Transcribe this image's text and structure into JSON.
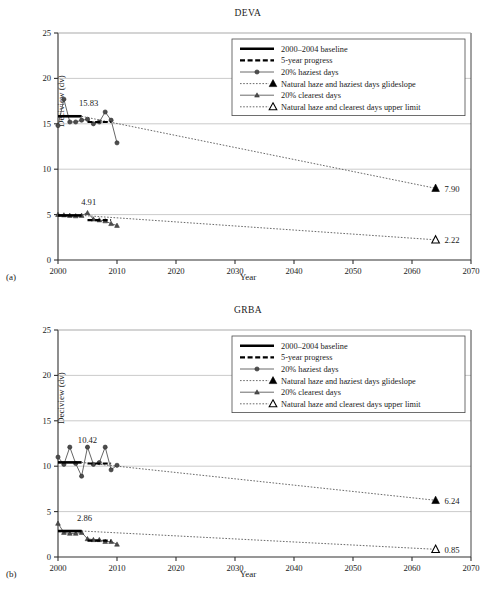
{
  "figure": {
    "axis_label_y": "Deciview (dv)",
    "axis_label_x": "Year",
    "panel_a_tag": "(a)",
    "panel_b_tag": "(b)"
  },
  "legend": {
    "items": [
      {
        "label": "2000–2004 baseline",
        "marker": "thick-solid-line"
      },
      {
        "label": "5-year progress",
        "marker": "thick-dashed-line"
      },
      {
        "label": "20% haziest days",
        "marker": "line-with-circle"
      },
      {
        "label": "Natural haze and haziest days glideslope",
        "marker": "dotted-line-filled-triangle"
      },
      {
        "label": "20% clearest days",
        "marker": "line-with-triangle"
      },
      {
        "label": "Natural haze and clearest days upper limit",
        "marker": "dotted-line-hollow-triangle"
      }
    ]
  },
  "chart_data": [
    {
      "type": "line",
      "title": "DEVA",
      "xlabel": "Year",
      "ylabel": "Deciview (dv)",
      "xlim": [
        2000,
        2070
      ],
      "ylim": [
        0,
        25
      ],
      "xticks": [
        2000,
        2010,
        2020,
        2030,
        2040,
        2050,
        2060,
        2070
      ],
      "yticks": [
        0,
        5,
        10,
        15,
        20,
        25
      ],
      "grid": "horizontal",
      "legend_position": "upper-right",
      "annotations": [
        {
          "text": "15.83",
          "x": 2005.2,
          "y": 17.0,
          "refers_to": "haziest-days-baseline"
        },
        {
          "text": "4.91",
          "x": 2005.2,
          "y": 6.1,
          "refers_to": "clearest-days-baseline"
        },
        {
          "text": "7.90",
          "x": 2065.5,
          "y": 7.9,
          "refers_to": "haziest-days-glideslope-endpoint"
        },
        {
          "text": "2.22",
          "x": 2065.5,
          "y": 2.22,
          "refers_to": "clearest-days-limit-endpoint"
        }
      ],
      "series": [
        {
          "name": "20% haziest days",
          "x": [
            2000,
            2001,
            2002,
            2003,
            2004,
            2005,
            2006,
            2007,
            2008,
            2009,
            2010
          ],
          "values": [
            14.8,
            17.7,
            15.2,
            15.2,
            15.4,
            15.5,
            15.0,
            15.2,
            16.3,
            15.4,
            12.9
          ]
        },
        {
          "name": "20% clearest days",
          "x": [
            2000,
            2001,
            2002,
            2003,
            2004,
            2005,
            2006,
            2007,
            2008,
            2009,
            2010
          ],
          "values": [
            5.0,
            4.95,
            4.9,
            4.85,
            4.9,
            5.2,
            4.5,
            4.4,
            4.3,
            4.0,
            3.8
          ]
        },
        {
          "name": "2000–2004 baseline (haziest)",
          "x": [
            2000,
            2004
          ],
          "values": [
            15.83,
            15.83
          ]
        },
        {
          "name": "2000–2004 baseline (clearest)",
          "x": [
            2000,
            2004
          ],
          "values": [
            4.91,
            4.91
          ]
        },
        {
          "name": "5-year progress (haziest)",
          "x": [
            2005,
            2009
          ],
          "values": [
            15.2,
            15.2
          ]
        },
        {
          "name": "5-year progress (clearest)",
          "x": [
            2005,
            2009
          ],
          "values": [
            4.4,
            4.4
          ]
        },
        {
          "name": "Natural haze and haziest days glideslope",
          "x": [
            2004,
            2064
          ],
          "values": [
            15.83,
            7.9
          ]
        },
        {
          "name": "Natural haze and clearest days upper limit",
          "x": [
            2004,
            2064
          ],
          "values": [
            4.91,
            2.22
          ]
        }
      ]
    },
    {
      "type": "line",
      "title": "GRBA",
      "xlabel": "Year",
      "ylabel": "Deciview (dv)",
      "xlim": [
        2000,
        2070
      ],
      "ylim": [
        0,
        25
      ],
      "xticks": [
        2000,
        2010,
        2020,
        2030,
        2040,
        2050,
        2060,
        2070
      ],
      "yticks": [
        0,
        5,
        10,
        15,
        20,
        25
      ],
      "grid": "horizontal",
      "legend_position": "upper-right",
      "annotations": [
        {
          "text": "10.42",
          "x": 2005.0,
          "y": 12.6,
          "refers_to": "haziest-days-baseline"
        },
        {
          "text": "2.86",
          "x": 2004.5,
          "y": 4.0,
          "refers_to": "clearest-days-baseline"
        },
        {
          "text": "6.24",
          "x": 2065.5,
          "y": 6.24,
          "refers_to": "haziest-days-glideslope-endpoint"
        },
        {
          "text": "0.85",
          "x": 2065.5,
          "y": 0.85,
          "refers_to": "clearest-days-limit-endpoint"
        }
      ],
      "series": [
        {
          "name": "20% haziest days",
          "x": [
            2000,
            2001,
            2002,
            2003,
            2004,
            2005,
            2006,
            2007,
            2008,
            2009,
            2010
          ],
          "values": [
            11.0,
            10.2,
            12.1,
            10.3,
            8.9,
            12.1,
            10.2,
            10.4,
            12.1,
            9.6,
            10.1
          ]
        },
        {
          "name": "20% clearest days",
          "x": [
            2000,
            2001,
            2002,
            2003,
            2004,
            2005,
            2006,
            2007,
            2008,
            2009,
            2010
          ],
          "values": [
            3.7,
            2.7,
            2.6,
            2.6,
            2.7,
            2.0,
            1.9,
            1.9,
            1.7,
            1.7,
            1.4
          ]
        },
        {
          "name": "2000–2004 baseline (haziest)",
          "x": [
            2000,
            2004
          ],
          "values": [
            10.42,
            10.42
          ]
        },
        {
          "name": "2000–2004 baseline (clearest)",
          "x": [
            2000,
            2004
          ],
          "values": [
            2.86,
            2.86
          ]
        },
        {
          "name": "5-year progress (haziest)",
          "x": [
            2005,
            2009
          ],
          "values": [
            10.3,
            10.3
          ]
        },
        {
          "name": "5-year progress (clearest)",
          "x": [
            2005,
            2009
          ],
          "values": [
            1.8,
            1.8
          ]
        },
        {
          "name": "Natural haze and haziest days glideslope",
          "x": [
            2004,
            2064
          ],
          "values": [
            10.42,
            6.24
          ]
        },
        {
          "name": "Natural haze and clearest days upper limit",
          "x": [
            2004,
            2064
          ],
          "values": [
            2.86,
            0.85
          ]
        }
      ]
    }
  ]
}
